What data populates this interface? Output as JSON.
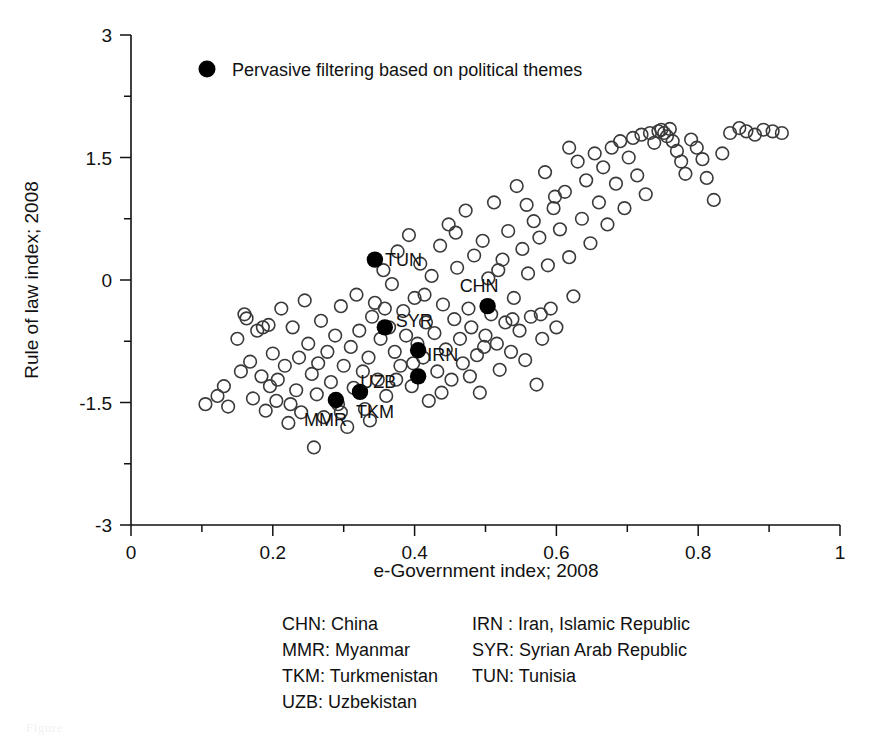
{
  "chart_data": {
    "type": "scatter",
    "title": "",
    "xlabel": "e-Government index; 2008",
    "ylabel": "Rule of law index; 2008",
    "xlim": [
      0,
      1
    ],
    "ylim": [
      -3,
      3
    ],
    "xticks": [
      0,
      0.2,
      0.4,
      0.6,
      0.8,
      1
    ],
    "xtick_labels": [
      "0",
      "0.2",
      "0.4",
      "0.6",
      "0.8",
      "1"
    ],
    "xminor_ticks": [
      0.1,
      0.3,
      0.5,
      0.7,
      0.9
    ],
    "yticks": [
      -3,
      -1.5,
      0,
      1.5,
      3
    ],
    "ytick_labels": [
      "-3",
      "-1.5",
      "0",
      "1.5",
      "3"
    ],
    "yminor_ticks": [
      -2.25,
      -0.75,
      0.75,
      2.25
    ],
    "grid": false,
    "legend_position": "top-left-inside",
    "series": [
      {
        "name": "Other countries",
        "marker": "open-circle",
        "color": "#3a3a3a",
        "points": [
          [
            0.105,
            -1.52
          ],
          [
            0.122,
            -1.42
          ],
          [
            0.131,
            -1.3
          ],
          [
            0.137,
            -1.55
          ],
          [
            0.15,
            -0.72
          ],
          [
            0.155,
            -1.12
          ],
          [
            0.16,
            -0.42
          ],
          [
            0.163,
            -0.47
          ],
          [
            0.168,
            -1.0
          ],
          [
            0.172,
            -1.45
          ],
          [
            0.178,
            -0.62
          ],
          [
            0.184,
            -1.18
          ],
          [
            0.19,
            -1.6
          ],
          [
            0.196,
            -1.3
          ],
          [
            0.2,
            -0.9
          ],
          [
            0.205,
            -1.48
          ],
          [
            0.207,
            -1.22
          ],
          [
            0.212,
            -0.35
          ],
          [
            0.217,
            -1.05
          ],
          [
            0.222,
            -1.75
          ],
          [
            0.228,
            -0.58
          ],
          [
            0.233,
            -1.35
          ],
          [
            0.237,
            -0.95
          ],
          [
            0.24,
            -1.62
          ],
          [
            0.245,
            -0.25
          ],
          [
            0.25,
            -0.78
          ],
          [
            0.255,
            -1.15
          ],
          [
            0.258,
            -2.05
          ],
          [
            0.262,
            -1.4
          ],
          [
            0.268,
            -0.5
          ],
          [
            0.272,
            -1.68
          ],
          [
            0.277,
            -0.88
          ],
          [
            0.282,
            -1.25
          ],
          [
            0.288,
            -0.68
          ],
          [
            0.292,
            -1.52
          ],
          [
            0.296,
            -0.32
          ],
          [
            0.3,
            -1.05
          ],
          [
            0.305,
            -1.8
          ],
          [
            0.31,
            -0.82
          ],
          [
            0.314,
            -1.32
          ],
          [
            0.318,
            -0.18
          ],
          [
            0.322,
            -0.62
          ],
          [
            0.327,
            -1.12
          ],
          [
            0.33,
            -1.58
          ],
          [
            0.335,
            -0.95
          ],
          [
            0.34,
            -0.45
          ],
          [
            0.344,
            -0.28
          ],
          [
            0.348,
            -1.22
          ],
          [
            0.352,
            -0.72
          ],
          [
            0.356,
            0.12
          ],
          [
            0.36,
            -1.42
          ],
          [
            0.364,
            -0.58
          ],
          [
            0.368,
            -0.05
          ],
          [
            0.372,
            -0.88
          ],
          [
            0.376,
            0.35
          ],
          [
            0.38,
            -1.05
          ],
          [
            0.384,
            -0.38
          ],
          [
            0.388,
            -0.68
          ],
          [
            0.392,
            0.55
          ],
          [
            0.396,
            -1.3
          ],
          [
            0.4,
            -0.22
          ],
          [
            0.404,
            -0.78
          ],
          [
            0.408,
            0.2
          ],
          [
            0.412,
            -0.95
          ],
          [
            0.416,
            -0.52
          ],
          [
            0.42,
            -1.48
          ],
          [
            0.424,
            0.05
          ],
          [
            0.428,
            -0.65
          ],
          [
            0.432,
            -1.12
          ],
          [
            0.436,
            0.42
          ],
          [
            0.44,
            -0.3
          ],
          [
            0.444,
            -0.85
          ],
          [
            0.448,
            0.68
          ],
          [
            0.452,
            -1.22
          ],
          [
            0.456,
            -0.48
          ],
          [
            0.46,
            0.15
          ],
          [
            0.464,
            -0.72
          ],
          [
            0.468,
            -1.02
          ],
          [
            0.472,
            0.85
          ],
          [
            0.476,
            -0.35
          ],
          [
            0.48,
            -0.58
          ],
          [
            0.484,
            0.3
          ],
          [
            0.488,
            -0.92
          ],
          [
            0.492,
            -1.38
          ],
          [
            0.496,
            0.48
          ],
          [
            0.5,
            -0.68
          ],
          [
            0.504,
            0.02
          ],
          [
            0.508,
            -0.42
          ],
          [
            0.512,
            0.95
          ],
          [
            0.516,
            -0.78
          ],
          [
            0.52,
            -1.1
          ],
          [
            0.524,
            0.25
          ],
          [
            0.528,
            -0.52
          ],
          [
            0.532,
            0.6
          ],
          [
            0.536,
            -0.88
          ],
          [
            0.54,
            -0.22
          ],
          [
            0.544,
            1.15
          ],
          [
            0.548,
            -0.62
          ],
          [
            0.552,
            0.38
          ],
          [
            0.556,
            -0.98
          ],
          [
            0.56,
            0.08
          ],
          [
            0.564,
            -0.45
          ],
          [
            0.568,
            0.72
          ],
          [
            0.572,
            -1.28
          ],
          [
            0.576,
            0.52
          ],
          [
            0.58,
            -0.72
          ],
          [
            0.584,
            1.32
          ],
          [
            0.588,
            0.18
          ],
          [
            0.592,
            -0.35
          ],
          [
            0.596,
            0.88
          ],
          [
            0.6,
            -0.58
          ],
          [
            0.605,
            0.62
          ],
          [
            0.612,
            1.08
          ],
          [
            0.618,
            0.28
          ],
          [
            0.624,
            -0.2
          ],
          [
            0.63,
            1.45
          ],
          [
            0.636,
            0.75
          ],
          [
            0.642,
            1.22
          ],
          [
            0.648,
            0.45
          ],
          [
            0.654,
            1.55
          ],
          [
            0.66,
            0.95
          ],
          [
            0.666,
            1.38
          ],
          [
            0.672,
            0.68
          ],
          [
            0.678,
            1.62
          ],
          [
            0.684,
            1.18
          ],
          [
            0.69,
            1.7
          ],
          [
            0.696,
            0.88
          ],
          [
            0.702,
            1.5
          ],
          [
            0.708,
            1.74
          ],
          [
            0.714,
            1.28
          ],
          [
            0.72,
            1.78
          ],
          [
            0.726,
            1.05
          ],
          [
            0.732,
            1.8
          ],
          [
            0.738,
            1.68
          ],
          [
            0.744,
            1.82
          ],
          [
            0.748,
            1.84
          ],
          [
            0.752,
            1.8
          ],
          [
            0.756,
            1.76
          ],
          [
            0.76,
            1.85
          ],
          [
            0.764,
            1.7
          ],
          [
            0.77,
            1.58
          ],
          [
            0.776,
            1.45
          ],
          [
            0.782,
            1.3
          ],
          [
            0.79,
            1.72
          ],
          [
            0.798,
            1.62
          ],
          [
            0.806,
            1.48
          ],
          [
            0.812,
            1.25
          ],
          [
            0.822,
            0.98
          ],
          [
            0.834,
            1.55
          ],
          [
            0.845,
            1.8
          ],
          [
            0.858,
            1.86
          ],
          [
            0.868,
            1.82
          ],
          [
            0.88,
            1.78
          ],
          [
            0.892,
            1.84
          ],
          [
            0.905,
            1.82
          ],
          [
            0.918,
            1.8
          ],
          [
            0.186,
            -0.58
          ],
          [
            0.194,
            -0.55
          ],
          [
            0.225,
            -1.52
          ],
          [
            0.264,
            -1.02
          ],
          [
            0.296,
            -1.62
          ],
          [
            0.337,
            -1.72
          ],
          [
            0.358,
            -0.35
          ],
          [
            0.374,
            -1.22
          ],
          [
            0.398,
            -1.02
          ],
          [
            0.414,
            -0.18
          ],
          [
            0.438,
            -1.38
          ],
          [
            0.458,
            0.58
          ],
          [
            0.478,
            -1.18
          ],
          [
            0.498,
            -0.82
          ],
          [
            0.518,
            0.12
          ],
          [
            0.538,
            -0.48
          ],
          [
            0.558,
            0.92
          ],
          [
            0.578,
            -0.42
          ],
          [
            0.598,
            1.02
          ],
          [
            0.618,
            1.62
          ]
        ]
      },
      {
        "name": "Pervasive filtering based on political themes",
        "marker": "filled-circle",
        "color": "#000000",
        "points": [
          {
            "code": "TUN",
            "x": 0.344,
            "y": 0.25,
            "label_dx": 10,
            "label_dy": 6
          },
          {
            "code": "CHN",
            "x": 0.503,
            "y": -0.32,
            "label_dx": -28,
            "label_dy": -14
          },
          {
            "code": "SYR",
            "x": 0.358,
            "y": -0.58,
            "label_dx": 11,
            "label_dy": 0
          },
          {
            "code": "IRN",
            "x": 0.405,
            "y": -0.86,
            "label_dx": 9,
            "label_dy": 11
          },
          {
            "code": "UZB",
            "x": 0.405,
            "y": -1.18,
            "label_dx": -58,
            "label_dy": 12
          },
          {
            "code": "TKM",
            "x": 0.323,
            "y": -1.37,
            "label_dx": -4,
            "label_dy": 26
          },
          {
            "code": "MMR",
            "x": 0.289,
            "y": -1.47,
            "label_dx": -32,
            "label_dy": 26
          }
        ]
      }
    ],
    "legend": {
      "entries": [
        {
          "label": "Pervasive filtering based on political themes",
          "marker": "filled-circle",
          "color": "#000000"
        }
      ]
    },
    "annotations": {
      "abbreviations": {
        "column_1": [
          "CHN: China",
          "MMR: Myanmar",
          "TKM: Turkmenistan",
          "UZB: Uzbekistan"
        ],
        "column_2": [
          "IRN : Iran, Islamic Republic",
          "SYR: Syrian Arab Republic",
          "TUN: Tunisia"
        ]
      }
    }
  },
  "figure": {
    "caption_fragment": "Figure"
  }
}
